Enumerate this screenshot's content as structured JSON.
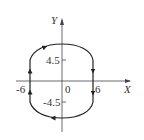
{
  "diagram": {
    "type": "phase-trajectory",
    "axes": {
      "x_label": "X",
      "y_label": "Y",
      "origin_label": "0"
    },
    "ticks": {
      "x": [
        "-6",
        "6"
      ],
      "y": [
        "4.5",
        "-4.5"
      ]
    },
    "curve": {
      "description": "closed clockwise trajectory: vertical segments at x=-6 (upward) and x=6 (downward) between y=-4.5 and y=4.5, joined by arcs above and below",
      "direction": "clockwise",
      "color": "#222222"
    }
  }
}
